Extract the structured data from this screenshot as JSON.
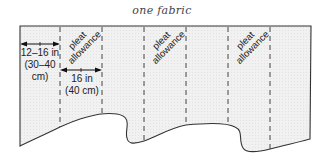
{
  "diagram": {
    "title": "one fabric",
    "panel_fill": "#efefef",
    "outline_color": "#333333",
    "dashed_line_color": "#444444",
    "pleat_labels": [
      {
        "line1": "pleat",
        "line2": "allowance"
      },
      {
        "line1": "pleat",
        "line2": "allowance"
      },
      {
        "line1": "pleat",
        "line2": "allowance"
      }
    ],
    "measurements": {
      "side": {
        "line1": "12–16 in",
        "line2": "(30–40",
        "line3": "cm)"
      },
      "pleat_width": {
        "line1": "16 in",
        "line2": "(40 cm)"
      }
    }
  }
}
